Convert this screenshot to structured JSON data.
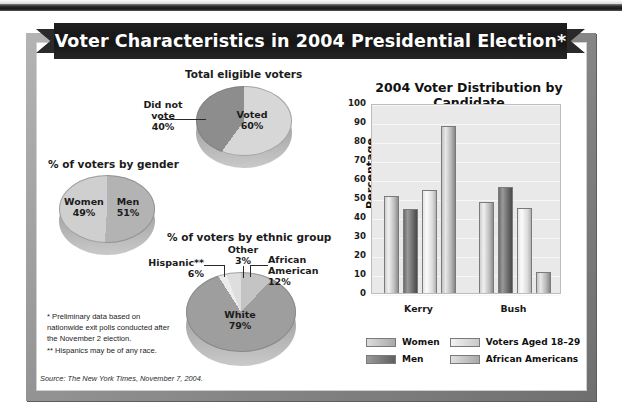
{
  "banner": {
    "title": "Voter Characteristics in 2004 Presidential Election*"
  },
  "pies": [
    {
      "caption": "Total eligible voters",
      "slices": [
        {
          "label": "Voted",
          "value": "60%",
          "pct": 60
        },
        {
          "label": "Did not vote",
          "value": "40%",
          "pct": 40
        }
      ]
    },
    {
      "caption": "% of voters by gender",
      "slices": [
        {
          "label": "Women",
          "value": "49%",
          "pct": 49
        },
        {
          "label": "Men",
          "value": "51%",
          "pct": 51
        }
      ]
    },
    {
      "caption": "% of voters by ethnic group",
      "slices": [
        {
          "label": "White",
          "value": "79%",
          "pct": 79
        },
        {
          "label": "African American",
          "value": "12%",
          "pct": 12
        },
        {
          "label": "Hispanic**",
          "value": "6%",
          "pct": 6
        },
        {
          "label": "Other",
          "value": "3%",
          "pct": 3
        }
      ]
    }
  ],
  "notes": {
    "note1": "* Preliminary data based on nationwide exit polls conducted after the November 2 election.",
    "note2": "** Hispanics may be of any race.",
    "source": "Source: The New York Times, November 7, 2004."
  },
  "chart_data": {
    "type": "bar",
    "title": "2004 Voter Distribution by Candidate",
    "xlabel": "",
    "ylabel": "Percentage",
    "ylim": [
      0,
      100
    ],
    "ytick_step": 10,
    "yticks": [
      "100",
      "90",
      "80",
      "70",
      "60",
      "50",
      "40",
      "30",
      "20",
      "10",
      "0"
    ],
    "categories": [
      "Kerry",
      "Bush"
    ],
    "grid": true,
    "legend_position": "bottom",
    "series": [
      {
        "name": "Women",
        "values": [
          51,
          48
        ]
      },
      {
        "name": "Men",
        "values": [
          44,
          56
        ]
      },
      {
        "name": "Voters Aged 18–29",
        "values": [
          54,
          45
        ]
      },
      {
        "name": "African Americans",
        "values": [
          88,
          11
        ]
      }
    ]
  }
}
